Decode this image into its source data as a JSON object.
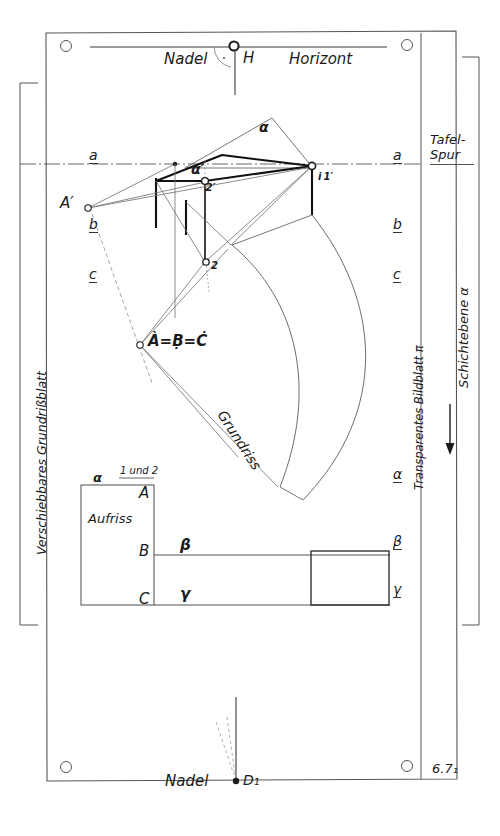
{
  "figure": {
    "number": "6.7₁",
    "title_top_left": "Nadel",
    "title_top_right": "Horizont",
    "apex_label": "H",
    "bottom_label": "Nadel",
    "bottom_point": "D₁"
  },
  "panels": {
    "left_caption": "Verschiebbares Grundrißblatt",
    "mid_caption": "Transparentes Bildblatt π",
    "right_caption_top": "Tafel-Spur",
    "right_caption_mid": "Schichtebene α"
  },
  "trace_labels_left": [
    {
      "text": "a",
      "x": 89,
      "y": 152
    },
    {
      "text": "b",
      "x": 89,
      "y": 221
    },
    {
      "text": "c",
      "x": 89,
      "y": 271
    }
  ],
  "trace_labels_right": [
    {
      "text": "a",
      "x": 393,
      "y": 152
    },
    {
      "text": "b",
      "x": 393,
      "y": 221
    },
    {
      "text": "c",
      "x": 393,
      "y": 271
    }
  ],
  "layer_labels_right": [
    {
      "text": "α",
      "x": 393,
      "y": 471
    },
    {
      "text": "β",
      "x": 393,
      "y": 538
    },
    {
      "text": "γ",
      "x": 393,
      "y": 586
    }
  ],
  "point_labels": [
    {
      "name": "A-prime",
      "text": "A′",
      "x": 62,
      "y": 197
    },
    {
      "name": "alpha-prime",
      "text": "α′",
      "x": 192,
      "y": 165
    },
    {
      "name": "two-prime",
      "text": "2′",
      "x": 202,
      "y": 186
    },
    {
      "name": "i-equals-one-prime",
      "text": "i 1′",
      "x": 316,
      "y": 176
    },
    {
      "name": "alpha-apex",
      "text": "α",
      "x": 261,
      "y": 124
    },
    {
      "name": "point-two",
      "text": "2",
      "x": 211,
      "y": 266
    },
    {
      "name": "abc-coincident",
      "text": "À=Ḅ=Ċ",
      "x": 127,
      "y": 337
    }
  ],
  "elevation": {
    "alpha_label": "α",
    "one_und_two": "1 und 2",
    "aufriss": "Aufriss",
    "A": "A",
    "B": "B",
    "C": "C",
    "beta": "β",
    "gamma": "γ"
  },
  "plan": {
    "grundriss": "Grundriss"
  },
  "colors": {
    "ink": "#1a1a1a",
    "line": "#555555",
    "thin": "#777777",
    "paper": "#ffffff"
  }
}
